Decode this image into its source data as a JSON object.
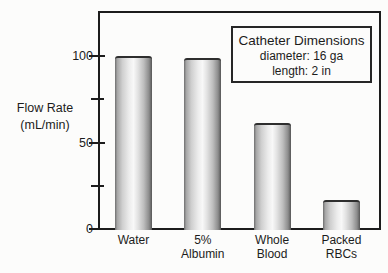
{
  "figure": {
    "background_color": "#fcfcfb",
    "frame_color": "#1c1c1c",
    "text_color": "#1c1c1c",
    "bar_edge_color": "#565656",
    "bar_highlight_color": "#f8f8f8"
  },
  "y_axis": {
    "label": "Flow Rate\n(mL/min)",
    "ticks": [
      {
        "value": 0,
        "label": "0",
        "minor": false
      },
      {
        "value": 25,
        "label": "",
        "minor": true
      },
      {
        "value": 50,
        "label": "50",
        "minor": false
      },
      {
        "value": 75,
        "label": "",
        "minor": true
      },
      {
        "value": 100,
        "label": "100",
        "minor": false
      }
    ]
  },
  "annotation_box": {
    "title": "Catheter Dimensions",
    "line1": "diameter: 16 ga",
    "line2": "length: 2 in"
  },
  "chart_data": {
    "type": "bar",
    "categories": [
      "Water",
      "5% Albumin",
      "Whole Blood",
      "Packed RBCs"
    ],
    "category_label_lines": [
      [
        "Water"
      ],
      [
        "5%",
        "Albumin"
      ],
      [
        "Whole",
        "Blood"
      ],
      [
        "Packed",
        "RBCs"
      ]
    ],
    "values": [
      100,
      99,
      61,
      17
    ],
    "title": "",
    "xlabel": "",
    "ylabel": "Flow Rate (mL/min)",
    "ylim": [
      0,
      127
    ],
    "yticks_labeled": [
      0,
      50,
      100
    ],
    "yticks_minor": [
      25,
      75
    ],
    "grid": false,
    "legend_position": "none",
    "bar_style": "cylindrical-gray-gradient",
    "annotation": "Catheter Dimensions — diameter: 16 ga, length: 2 in"
  }
}
